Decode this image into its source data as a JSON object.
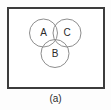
{
  "figure": {
    "caption": "(a)",
    "frame": {
      "border_color": "#3c3c3c",
      "background_color": "#ffffff"
    },
    "page_background": "#fdfdfd",
    "diagram": {
      "type": "venn",
      "circle_stroke_color": "#8d8d8d",
      "circle_fill_color": "#ffffff",
      "label_color": "#2b2b2b",
      "radius": 14,
      "sets": [
        {
          "id": "set-a",
          "label": "A",
          "cx": 43.5,
          "cy": 33,
          "r": 14,
          "position": "top-left"
        },
        {
          "id": "set-c",
          "label": "C",
          "cx": 67,
          "cy": 33,
          "r": 14,
          "position": "top-right"
        },
        {
          "id": "set-b",
          "label": "B",
          "cx": 55,
          "cy": 53.5,
          "r": 14,
          "position": "bottom-center"
        }
      ]
    }
  }
}
